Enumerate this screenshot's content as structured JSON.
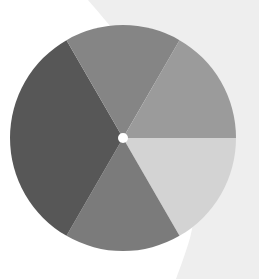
{
  "figure": {
    "background": {
      "base_color": "#ffffff",
      "shape_color": "#eeeeee"
    },
    "wheel": {
      "center": [
        123,
        138
      ],
      "radius": 113,
      "center_dot_color": "#ffffff",
      "sectors": [
        {
          "name": "right-lower",
          "start_deg": 0,
          "end_deg": 60,
          "color": "#d3d3d3"
        },
        {
          "name": "bottom",
          "start_deg": 60,
          "end_deg": 120,
          "color": "#7b7b7b"
        },
        {
          "name": "left-lower",
          "start_deg": 120,
          "end_deg": 180,
          "color": "#575757"
        },
        {
          "name": "left-upper",
          "start_deg": 180,
          "end_deg": 240,
          "color": "#575757"
        },
        {
          "name": "top",
          "start_deg": 240,
          "end_deg": 300,
          "color": "#858585"
        },
        {
          "name": "right-upper",
          "start_deg": 300,
          "end_deg": 360,
          "color": "#9b9b9b"
        }
      ]
    }
  }
}
